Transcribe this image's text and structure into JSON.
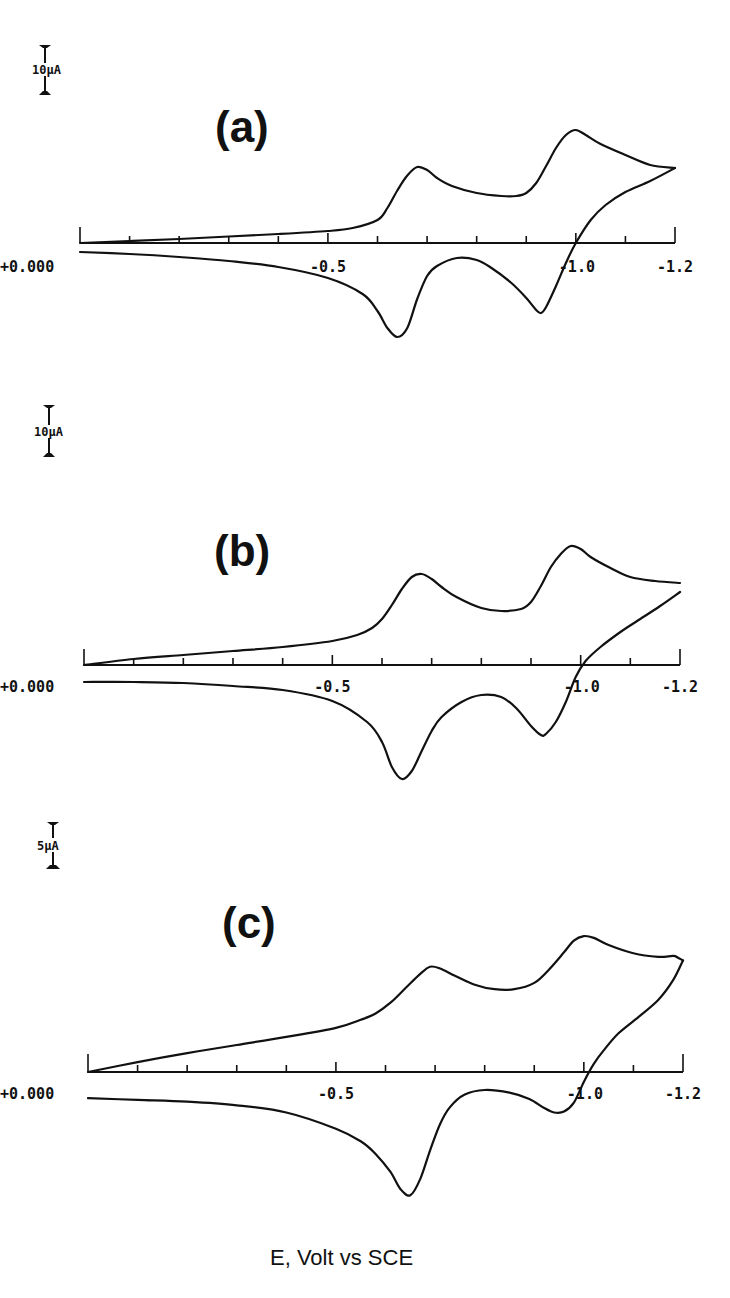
{
  "chart_data": {
    "type": "line",
    "title": "",
    "xlabel": "E, Volt vs SCE",
    "ylabel": "",
    "panels": [
      {
        "label": "(a)",
        "scale_bar": "10µA",
        "scale_bar_uA": 10,
        "xlim": [
          0.0,
          -1.2
        ],
        "tick_step": -0.1,
        "tick_labels": [
          "+0.000",
          "-0.5",
          "-1.0",
          "-1.2"
        ],
        "tick_label_values": [
          0.0,
          -0.5,
          -1.0,
          -1.2
        ],
        "series": [
          {
            "name": "cathodic-sweep",
            "E": [
              0.0,
              -0.1,
              -0.2,
              -0.3,
              -0.4,
              -0.5,
              -0.55,
              -0.6,
              -0.62,
              -0.64,
              -0.66,
              -0.68,
              -0.7,
              -0.72,
              -0.75,
              -0.8,
              -0.85,
              -0.88,
              -0.9,
              -0.92,
              -0.94,
              -0.96,
              -0.98,
              -1.0,
              -1.02,
              -1.05,
              -1.1,
              -1.15,
              -1.2
            ],
            "I_uA": [
              0.0,
              0.4,
              0.8,
              1.3,
              1.8,
              2.4,
              3.0,
              4.6,
              7.0,
              10.5,
              13.5,
              15.2,
              14.6,
              13.0,
              11.4,
              10.0,
              9.4,
              9.4,
              10.0,
              12.0,
              15.4,
              19.0,
              21.6,
              22.6,
              21.6,
              19.8,
              17.6,
              15.6,
              15.0
            ]
          },
          {
            "name": "anodic-sweep",
            "E": [
              -1.2,
              -1.15,
              -1.1,
              -1.06,
              -1.03,
              -1.0,
              -0.98,
              -0.96,
              -0.94,
              -0.93,
              -0.92,
              -0.9,
              -0.87,
              -0.83,
              -0.8,
              -0.76,
              -0.72,
              -0.7,
              -0.68,
              -0.66,
              -0.64,
              -0.62,
              -0.6,
              -0.57,
              -0.5,
              -0.4,
              -0.3,
              -0.2,
              -0.1,
              0.0
            ],
            "I_uA": [
              15.0,
              12.4,
              10.2,
              7.6,
              4.6,
              0.0,
              -4.0,
              -8.6,
              -12.8,
              -14.0,
              -13.4,
              -11.0,
              -8.0,
              -5.0,
              -3.4,
              -3.0,
              -4.6,
              -6.6,
              -11.2,
              -17.0,
              -18.8,
              -17.0,
              -13.6,
              -10.2,
              -7.0,
              -4.8,
              -3.6,
              -2.8,
              -2.2,
              -1.8
            ]
          }
        ]
      },
      {
        "label": "(b)",
        "scale_bar": "10µA",
        "scale_bar_uA": 10,
        "xlim": [
          0.0,
          -1.2
        ],
        "tick_step": -0.1,
        "tick_labels": [
          "+0.000",
          "-0.5",
          "-1.0",
          "-1.2"
        ],
        "tick_label_values": [
          0.0,
          -0.5,
          -1.0,
          -1.2
        ],
        "series": [
          {
            "name": "cathodic-sweep",
            "E": [
              0.0,
              -0.1,
              -0.2,
              -0.3,
              -0.4,
              -0.5,
              -0.55,
              -0.58,
              -0.6,
              -0.62,
              -0.64,
              -0.66,
              -0.68,
              -0.7,
              -0.72,
              -0.75,
              -0.8,
              -0.84,
              -0.88,
              -0.9,
              -0.92,
              -0.94,
              -0.96,
              -0.98,
              -1.0,
              -1.02,
              -1.06,
              -1.1,
              -1.15,
              -1.2
            ],
            "I_uA": [
              0.0,
              1.2,
              2.0,
              2.8,
              3.6,
              4.8,
              6.0,
              7.4,
              9.2,
              12.0,
              15.2,
              17.6,
              18.2,
              17.2,
              15.6,
              13.6,
              11.4,
              10.8,
              11.2,
              12.6,
              15.8,
              19.6,
              22.2,
              23.8,
              23.2,
              21.6,
              19.4,
              17.6,
              16.8,
              16.4
            ]
          },
          {
            "name": "anodic-sweep",
            "E": [
              -1.2,
              -1.16,
              -1.12,
              -1.08,
              -1.04,
              -1.01,
              -0.99,
              -0.97,
              -0.95,
              -0.93,
              -0.92,
              -0.9,
              -0.87,
              -0.84,
              -0.8,
              -0.76,
              -0.72,
              -0.7,
              -0.68,
              -0.66,
              -0.64,
              -0.62,
              -0.6,
              -0.57,
              -0.5,
              -0.4,
              -0.3,
              -0.2,
              -0.1,
              0.0
            ],
            "I_uA": [
              14.6,
              11.8,
              9.2,
              6.6,
              3.6,
              0.8,
              -2.4,
              -7.4,
              -11.4,
              -13.8,
              -14.0,
              -12.2,
              -8.6,
              -6.4,
              -6.0,
              -7.4,
              -10.4,
              -13.2,
              -17.2,
              -21.2,
              -22.8,
              -20.4,
              -15.4,
              -11.4,
              -7.2,
              -5.0,
              -4.2,
              -3.6,
              -3.4,
              -3.4
            ]
          }
        ]
      },
      {
        "label": "(c)",
        "scale_bar": "5µA",
        "scale_bar_uA": 5,
        "xlim": [
          0.0,
          -1.2
        ],
        "tick_step": -0.1,
        "tick_labels": [
          "+0.000",
          "-0.5",
          "-1.0",
          "-1.2"
        ],
        "tick_label_values": [
          0.0,
          -0.5,
          -1.0,
          -1.2
        ],
        "series": [
          {
            "name": "cathodic-sweep",
            "E": [
              0.0,
              -0.1,
              -0.2,
              -0.3,
              -0.4,
              -0.5,
              -0.55,
              -0.58,
              -0.61,
              -0.64,
              -0.67,
              -0.69,
              -0.71,
              -0.74,
              -0.78,
              -0.82,
              -0.86,
              -0.9,
              -0.93,
              -0.96,
              -0.98,
              -1.0,
              -1.02,
              -1.05,
              -1.1,
              -1.15,
              -1.18,
              -1.19,
              -1.2
            ],
            "I_uA": [
              0.0,
              2.2,
              4.2,
              6.0,
              7.8,
              9.8,
              11.6,
              13.0,
              15.4,
              18.6,
              21.8,
              23.4,
              23.0,
              21.4,
              19.4,
              18.4,
              18.4,
              19.8,
              22.8,
              26.6,
              29.2,
              30.2,
              29.8,
              28.2,
              26.4,
              25.6,
              25.8,
              25.4,
              24.8
            ]
          },
          {
            "name": "anodic-sweep",
            "E": [
              -1.2,
              -1.18,
              -1.15,
              -1.11,
              -1.07,
              -1.04,
              -1.02,
              -1.0,
              -0.98,
              -0.96,
              -0.94,
              -0.92,
              -0.89,
              -0.85,
              -0.8,
              -0.76,
              -0.73,
              -0.71,
              -0.69,
              -0.67,
              -0.65,
              -0.63,
              -0.61,
              -0.58,
              -0.55,
              -0.5,
              -0.4,
              -0.3,
              -0.2,
              -0.1,
              0.0
            ],
            "I_uA": [
              24.8,
              20.4,
              16.0,
              12.2,
              8.6,
              4.8,
              1.8,
              -2.2,
              -6.8,
              -8.8,
              -9.0,
              -8.0,
              -6.0,
              -4.6,
              -4.0,
              -5.0,
              -7.8,
              -11.6,
              -17.4,
              -23.8,
              -27.4,
              -26.0,
              -22.2,
              -18.2,
              -15.4,
              -12.6,
              -9.0,
              -7.4,
              -6.6,
              -6.2,
              -5.8
            ]
          }
        ]
      }
    ]
  }
}
